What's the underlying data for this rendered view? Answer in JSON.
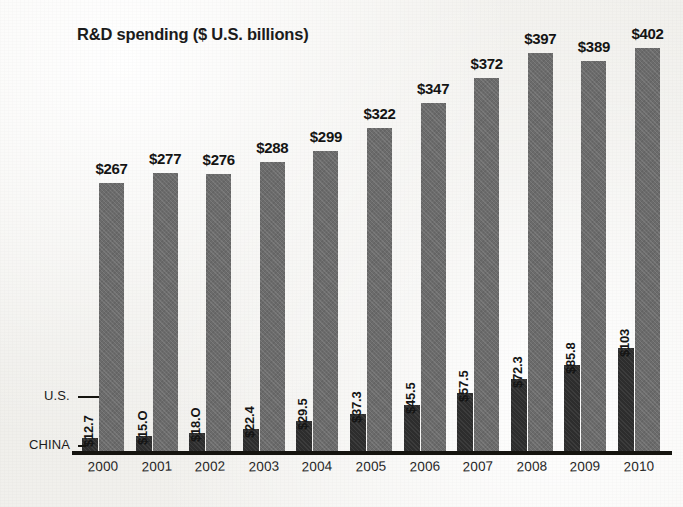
{
  "chart_data": {
    "type": "bar",
    "title": "R&D spending ($ U.S. billions)",
    "xlabel": "",
    "ylabel": "",
    "ylim": [
      0,
      402
    ],
    "grid": false,
    "legend_position": "left-inline-callouts",
    "categories": [
      "2000",
      "2001",
      "2002",
      "2003",
      "2004",
      "2005",
      "2006",
      "2007",
      "2008",
      "2009",
      "2010"
    ],
    "series": [
      {
        "name": "U.S.",
        "values": [
          267,
          277,
          276,
          288,
          299,
          322,
          347,
          372,
          397,
          389,
          402
        ],
        "labels": [
          "$267",
          "$277",
          "$276",
          "$288",
          "$299",
          "$322",
          "$347",
          "$372",
          "$397",
          "$389",
          "$402"
        ],
        "color": "#6b6b6b"
      },
      {
        "name": "CHINA",
        "values": [
          12.7,
          15.0,
          18.0,
          22.4,
          29.5,
          37.3,
          45.5,
          57.5,
          72.3,
          85.8,
          103
        ],
        "labels": [
          "$12.7",
          "$15.O",
          "$18.O",
          "$22.4",
          "$29.5",
          "$37.3",
          "$45.5",
          "$57.5",
          "$72.3",
          "$85.8",
          "$103"
        ],
        "color": "#2d2d2d"
      }
    ]
  },
  "legend": {
    "us_label": "U.S.",
    "china_label": "CHINA"
  },
  "colors": {
    "background": "#f3f2ef",
    "axis": "#15140f",
    "us_bar": "#6b6b6b",
    "china_bar": "#2d2d2d",
    "text": "#1b1b1b"
  }
}
